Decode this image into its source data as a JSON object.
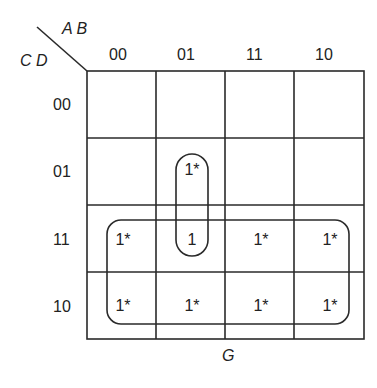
{
  "diagram": {
    "type": "karnaugh-map",
    "row_variables": "C D",
    "col_variables": "A B",
    "output_name": "G",
    "columns": [
      "00",
      "01",
      "11",
      "10"
    ],
    "rows": [
      "00",
      "01",
      "11",
      "10"
    ],
    "cells": [
      [
        "",
        "",
        "",
        ""
      ],
      [
        "",
        "1*",
        "",
        ""
      ],
      [
        "1*",
        "1",
        "1*",
        "1*"
      ],
      [
        "1*",
        "1*",
        "1*",
        "1*"
      ]
    ],
    "groups": [
      {
        "name": "vertical-pair",
        "cells": [
          "01/01",
          "11/01"
        ]
      },
      {
        "name": "bottom-octet",
        "cells": [
          "rows 11,10 all columns"
        ]
      }
    ]
  }
}
